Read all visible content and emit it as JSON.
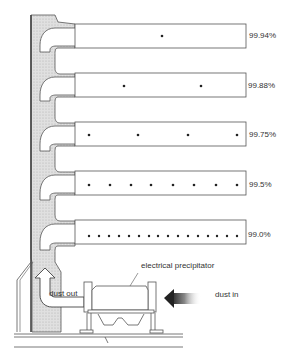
{
  "diagram": {
    "title": "",
    "stages": [
      {
        "efficiency": "99.94%",
        "dots": 1
      },
      {
        "efficiency": "99.88%",
        "dots": 2
      },
      {
        "efficiency": "99.75%",
        "dots": 4
      },
      {
        "efficiency": "99.5%",
        "dots": 8
      },
      {
        "efficiency": "99.0%",
        "dots": 16
      }
    ],
    "labels": {
      "precipitator": "electrical precipitator",
      "dust_out": "dust out",
      "dust_in": "dust in"
    },
    "colors": {
      "line": "#555555",
      "chimney_fill": "#d8d8d8",
      "dot": "#222222",
      "arrow": "#333333"
    }
  }
}
